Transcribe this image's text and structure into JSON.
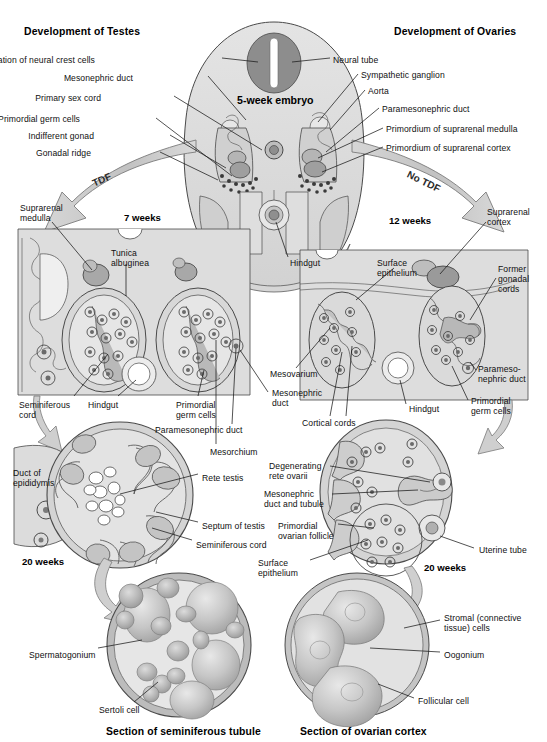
{
  "figure": {
    "title_left": "Development of Testes",
    "title_right": "Development of Ovaries",
    "embryo_title": "5-week embryo",
    "caption_left": "Section of seminiferous tubule",
    "caption_right": "Section of ovarian cortex",
    "colors": {
      "ink": "#101010",
      "outline": "#3a3a3a",
      "tissue_light": "#e2e2e2",
      "tissue_mid": "#c9c9c9",
      "tissue_dark": "#a8a8a8",
      "tissue_darker": "#8c8c8c",
      "neural_tube": "#8a8a8a",
      "arrow_fill": "#cfcfcf",
      "panel_fill": "#dcdcdc",
      "background": "#ffffff"
    }
  },
  "arrows": {
    "tdf": "TDF",
    "no_tdf": "No TDF"
  },
  "stages": {
    "testes_7w": "7 weeks",
    "ovaries_12w": "12 weeks",
    "testes_20w": "20 weeks",
    "ovaries_20w": "20 weeks"
  },
  "labels_embryo": [
    {
      "id": "aggregation-of-neural-crest-cells",
      "text": "Aggregation of neural crest cells",
      "align": "right",
      "x": 95,
      "y": 55
    },
    {
      "id": "neural-tube",
      "text": "Neural tube",
      "align": "left",
      "x": 333,
      "y": 55
    },
    {
      "id": "mesonephric-duct-embryo",
      "text": "Mesonephric duct",
      "align": "right",
      "x": 133,
      "y": 73
    },
    {
      "id": "sympathetic-ganglion",
      "text": "Sympathetic ganglion",
      "align": "left",
      "x": 361,
      "y": 70
    },
    {
      "id": "primary-sex-cord",
      "text": "Primary sex cord",
      "align": "right",
      "x": 101,
      "y": 93
    },
    {
      "id": "aorta",
      "text": "Aorta",
      "align": "left",
      "x": 368,
      "y": 86
    },
    {
      "id": "primordial-germ-cells-embryo",
      "text": "Primordial germ cells",
      "align": "right",
      "x": 80,
      "y": 114
    },
    {
      "id": "paramesonephric-duct-embryo",
      "text": "Paramesonephric duct",
      "align": "left",
      "x": 382,
      "y": 104
    },
    {
      "id": "indifferent-gonad",
      "text": "Indifferent gonad",
      "align": "right",
      "x": 94,
      "y": 131
    },
    {
      "id": "primordium-of-suprarenal-medulla",
      "text": "Primordium of suprarenal medulla",
      "align": "left",
      "x": 386,
      "y": 124
    },
    {
      "id": "gonadal-ridge",
      "text": "Gonadal ridge",
      "align": "right",
      "x": 91,
      "y": 148
    },
    {
      "id": "primordium-of-suprarenal-cortex",
      "text": "Primordium of suprarenal cortex",
      "align": "left",
      "x": 386,
      "y": 143
    },
    {
      "id": "hindgut-embryo",
      "text": "Hindgut",
      "align": "left",
      "x": 290,
      "y": 258
    }
  ],
  "labels_testes_7w": [
    {
      "id": "suprarenal-medulla",
      "text": "Suprarenal\nmedulla",
      "align": "left",
      "x": 20,
      "y": 203
    },
    {
      "id": "tunica-albuginea",
      "text": "Tunica\nalbuginea",
      "align": "left",
      "x": 111,
      "y": 248
    },
    {
      "id": "seminiferous-cord-7w",
      "text": "Seminiferous\ncord",
      "align": "left",
      "x": 19,
      "y": 400
    },
    {
      "id": "hindgut-testes",
      "text": "Hindgut",
      "align": "left",
      "x": 88,
      "y": 400
    },
    {
      "id": "primordial-germ-cells-testes",
      "text": "Primordial\ngerm cells",
      "align": "left",
      "x": 176,
      "y": 400
    },
    {
      "id": "mesorchium",
      "text": "Mesorchium",
      "align": "left",
      "x": 210,
      "y": 447
    },
    {
      "id": "paramesonephric-duct-testes",
      "text": "Paramesonephric duct",
      "align": "left",
      "x": 155,
      "y": 425
    },
    {
      "id": "mesonephric-duct-testes",
      "text": "Mesonephric\nduct",
      "align": "left",
      "x": 272,
      "y": 388
    }
  ],
  "labels_ovaries_12w": [
    {
      "id": "suprarenal-cortex",
      "text": "Suprarenal\ncortex",
      "align": "left",
      "x": 487,
      "y": 207
    },
    {
      "id": "surface-epithelium-12w",
      "text": "Surface\nepithelium",
      "align": "left",
      "x": 377,
      "y": 258
    },
    {
      "id": "former-gonadal-cords",
      "text": "Former\ngonadal\ncords",
      "align": "left",
      "x": 498,
      "y": 264
    },
    {
      "id": "mesovarium",
      "text": "Mesovarium",
      "align": "left",
      "x": 270,
      "y": 369
    },
    {
      "id": "cortical-cords",
      "text": "Cortical cords",
      "align": "left",
      "x": 302,
      "y": 418
    },
    {
      "id": "hindgut-ovaries",
      "text": "Hindgut",
      "align": "left",
      "x": 409,
      "y": 404
    },
    {
      "id": "paramesonephric-duct-ovaries",
      "text": "Parameso-\nnephric duct",
      "align": "left",
      "x": 478,
      "y": 364
    },
    {
      "id": "primordial-germ-cells-ovaries",
      "text": "Primordial\ngerm cells",
      "align": "left",
      "x": 471,
      "y": 396
    }
  ],
  "labels_testes_20w": [
    {
      "id": "duct-of-epididymis",
      "text": "Duct of\nepididymis",
      "align": "left",
      "x": 13,
      "y": 468
    },
    {
      "id": "rete-testis",
      "text": "Rete testis",
      "align": "left",
      "x": 202,
      "y": 473
    },
    {
      "id": "septum-of-testis",
      "text": "Septum of testis",
      "align": "left",
      "x": 202,
      "y": 521
    },
    {
      "id": "seminiferous-cord-20w",
      "text": "Seminiferous cord",
      "align": "left",
      "x": 196,
      "y": 540
    },
    {
      "id": "spermatogonium",
      "text": "Spermatogonium",
      "align": "left",
      "x": 29,
      "y": 650
    },
    {
      "id": "sertoli-cell",
      "text": "Sertoli cell",
      "align": "left",
      "x": 99,
      "y": 705
    }
  ],
  "labels_ovaries_20w": [
    {
      "id": "degenerating-rete-ovarii",
      "text": "Degenerating\nrete ovarii",
      "align": "left",
      "x": 269,
      "y": 461
    },
    {
      "id": "mesonephric-duct-and-tubule",
      "text": "Mesonephric\nduct and tubule",
      "align": "left",
      "x": 264,
      "y": 489
    },
    {
      "id": "primordial-ovarian-follicle",
      "text": "Primordial\novarian follicle",
      "align": "left",
      "x": 278,
      "y": 521
    },
    {
      "id": "surface-epithelium-20w",
      "text": "Surface\nepithelium",
      "align": "left",
      "x": 258,
      "y": 558
    },
    {
      "id": "uterine-tube",
      "text": "Uterine tube",
      "align": "left",
      "x": 479,
      "y": 545
    },
    {
      "id": "stromal-connective-tissue-cells",
      "text": "Stromal (connective\ntissue) cells",
      "align": "left",
      "x": 444,
      "y": 613
    },
    {
      "id": "oogonium",
      "text": "Oogonium",
      "align": "left",
      "x": 444,
      "y": 650
    },
    {
      "id": "follicular-cell",
      "text": "Follicular cell",
      "align": "left",
      "x": 418,
      "y": 696
    }
  ]
}
